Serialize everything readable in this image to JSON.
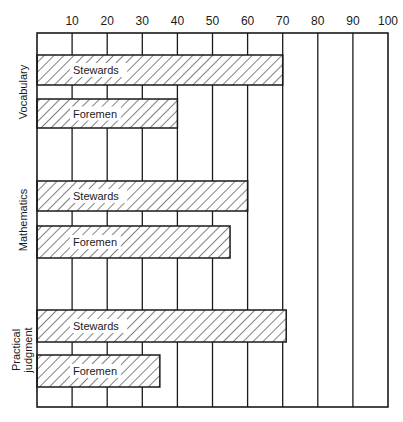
{
  "chart_data": {
    "type": "bar",
    "orientation": "horizontal",
    "title": "",
    "xlabel": "",
    "ylabel": "",
    "xlim": [
      0,
      100
    ],
    "x_ticks": [
      10,
      20,
      30,
      40,
      50,
      60,
      70,
      80,
      90,
      100
    ],
    "x_axis_position": "top",
    "grid": true,
    "categories": [
      "Vocabulary",
      "Mathematics",
      "Practical judgment"
    ],
    "series": [
      {
        "name": "Stewards",
        "values": [
          70,
          60,
          71
        ]
      },
      {
        "name": "Foremen",
        "values": [
          40,
          55,
          35
        ]
      }
    ],
    "bar_fill": "diagonal-hatch",
    "legend": "none (series names written inside bars)"
  },
  "labels": {
    "cat0": "Vocabulary",
    "cat1": "Mathematics",
    "cat2_line1": "Practical",
    "cat2_line2": "judgment",
    "stewards": "Stewards",
    "foremen": "Foremen"
  },
  "colors": {
    "ink": "#1a1a1a",
    "background": "#ffffff"
  }
}
